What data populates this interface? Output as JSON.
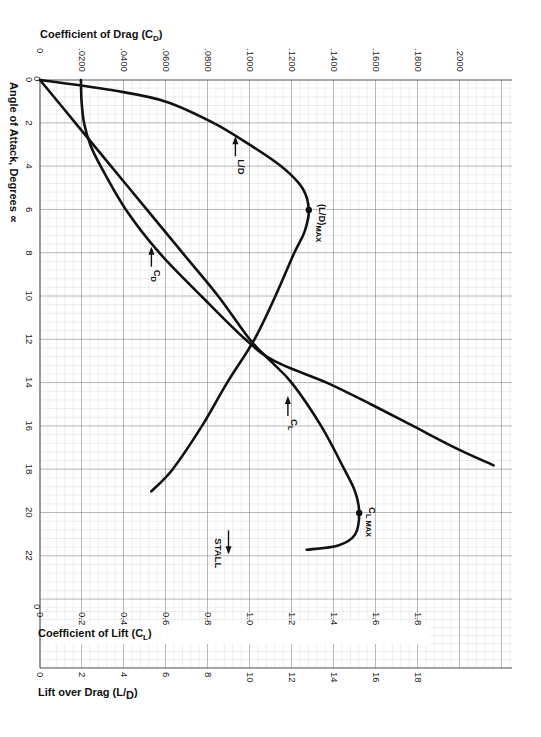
{
  "chart_data": {
    "type": "line",
    "title": "",
    "orientation": "rotated 90° clockwise (angle of attack runs top-to-bottom)",
    "axes": {
      "angle_of_attack": {
        "label": "Angle of Attack, Degrees ∝",
        "ticks": [
          "0",
          "2",
          "4",
          "6",
          "8",
          "10",
          "12",
          "14",
          "16",
          "18",
          "20",
          "22"
        ],
        "range": [
          0,
          24.2
        ]
      },
      "drag": {
        "label": "Coefficient of Drag (C",
        "label_sub": "D",
        "label_end": ")",
        "ticks": [
          "0",
          ".0200",
          ".0400",
          ".0600",
          ".0800",
          ".1000",
          ".1200",
          ".1400",
          ".1600",
          ".1800",
          ".2000"
        ],
        "range": [
          0,
          0.224
        ]
      },
      "lift": {
        "label": "Coefficient of Lift (C",
        "label_sub": "L",
        "label_end": ")",
        "ticks": [
          "0",
          "0.2",
          "0.4",
          "0.6",
          "0.8",
          "1.0",
          "1.2",
          "1.4",
          "1.6",
          "1.8"
        ],
        "range": [
          0,
          2.24
        ]
      },
      "lift_over_drag": {
        "label": "Lift over Drag (L/",
        "label_sub": "D",
        "label_end": ")",
        "ticks": [
          "0",
          "2",
          "4",
          "6",
          "8",
          "10",
          "12",
          "14",
          "16",
          "18"
        ],
        "range": [
          0,
          22.4
        ]
      }
    },
    "series": [
      {
        "name": "CL",
        "label": "C",
        "label_sub": "L",
        "unit_axis": "lift",
        "points": [
          [
            0,
            0
          ],
          [
            2,
            0.17
          ],
          [
            4,
            0.34
          ],
          [
            6,
            0.51
          ],
          [
            8,
            0.68
          ],
          [
            10,
            0.85
          ],
          [
            12,
            1.0
          ],
          [
            13,
            1.1
          ],
          [
            14,
            1.2
          ],
          [
            16,
            1.34
          ],
          [
            18,
            1.45
          ],
          [
            19,
            1.5
          ],
          [
            20,
            1.52
          ],
          [
            21,
            1.5
          ],
          [
            21.5,
            1.42
          ],
          [
            21.7,
            1.27
          ]
        ]
      },
      {
        "name": "CD",
        "label": "C",
        "label_sub": "D",
        "unit_axis": "drag",
        "points": [
          [
            0,
            0.0195
          ],
          [
            1,
            0.0198
          ],
          [
            2,
            0.021
          ],
          [
            3,
            0.024
          ],
          [
            4,
            0.029
          ],
          [
            6,
            0.041
          ],
          [
            8,
            0.057
          ],
          [
            10,
            0.077
          ],
          [
            12,
            0.098
          ],
          [
            13,
            0.112
          ],
          [
            14,
            0.137
          ],
          [
            15,
            0.158
          ],
          [
            16,
            0.178
          ],
          [
            17,
            0.198
          ],
          [
            17.8,
            0.216
          ]
        ]
      },
      {
        "name": "L/D",
        "label": "L/D",
        "unit_axis": "lift_over_drag",
        "points": [
          [
            0,
            0
          ],
          [
            0.5,
            3.6
          ],
          [
            1,
            6.0
          ],
          [
            2,
            8.3
          ],
          [
            3,
            10.0
          ],
          [
            4,
            11.5
          ],
          [
            5,
            12.5
          ],
          [
            6,
            12.8
          ],
          [
            7,
            12.6
          ],
          [
            8,
            12.1
          ],
          [
            10,
            11.2
          ],
          [
            12,
            10.2
          ],
          [
            14,
            8.9
          ],
          [
            16,
            7.7
          ],
          [
            18,
            6.3
          ],
          [
            19,
            5.3
          ]
        ]
      }
    ],
    "annotations": [
      {
        "text": "L/D",
        "at_deg": 2.6,
        "at_value": 9.4,
        "axis": "lift_over_drag",
        "arrow": "up"
      },
      {
        "text": "(L/D)",
        "sub": "MAX",
        "at_deg": 6,
        "at_value": 12.8,
        "axis": "lift_over_drag",
        "marker": "dot"
      },
      {
        "text": "C",
        "sub": "D",
        "at_deg": 7.7,
        "at_value": 0.054,
        "axis": "drag",
        "arrow": "up"
      },
      {
        "text": "C",
        "sub": "L",
        "at_deg": 14.6,
        "at_value": 1.19,
        "axis": "lift",
        "arrow": "up"
      },
      {
        "text": "C",
        "sub": "L MAX",
        "at_deg": 20,
        "at_value": 1.52,
        "axis": "lift",
        "marker": "dot"
      },
      {
        "text": "STALL",
        "at_deg": 20.8,
        "at_value": 0.45,
        "axis": "lift",
        "arrow": "down"
      }
    ],
    "grid": true,
    "legend": "none (inline curve annotations)"
  }
}
